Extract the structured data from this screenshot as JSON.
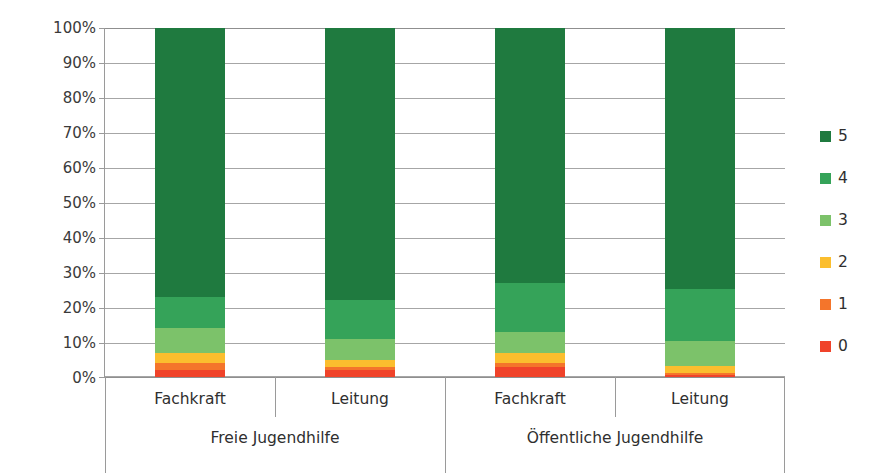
{
  "chart_data": {
    "type": "bar",
    "subtype": "stacked-percent",
    "title": "",
    "xlabel": "",
    "ylabel": "",
    "ylim": [
      0,
      100
    ],
    "y_tick_labels": [
      "0%",
      "10%",
      "20%",
      "30%",
      "40%",
      "50%",
      "60%",
      "70%",
      "80%",
      "90%",
      "100%"
    ],
    "y_tick_values": [
      0,
      10,
      20,
      30,
      40,
      50,
      60,
      70,
      80,
      90,
      100
    ],
    "grid": true,
    "legend_position": "right",
    "categories": [
      "Fachkraft",
      "Leitung",
      "Fachkraft",
      "Leitung"
    ],
    "groups": [
      {
        "label": "Freie Jugendhilfe",
        "categories": [
          "Fachkraft",
          "Leitung"
        ]
      },
      {
        "label": "Öffentliche Jugendhilfe",
        "categories": [
          "Fachkraft",
          "Leitung"
        ]
      }
    ],
    "series": [
      {
        "name": "0",
        "color": "#F0432A",
        "values": [
          2.0,
          2.0,
          3.0,
          0.6
        ]
      },
      {
        "name": "1",
        "color": "#F4752B",
        "values": [
          2.0,
          1.0,
          1.0,
          0.6
        ]
      },
      {
        "name": "2",
        "color": "#FBBE2E",
        "values": [
          3.0,
          2.0,
          3.0,
          2.0
        ]
      },
      {
        "name": "3",
        "color": "#7CC26A",
        "values": [
          7.0,
          6.0,
          6.0,
          7.0
        ]
      },
      {
        "name": "4",
        "color": "#35A359",
        "values": [
          9.0,
          11.0,
          14.0,
          15.0
        ]
      },
      {
        "name": "5",
        "color": "#1F7A3F",
        "values": [
          77.0,
          78.0,
          73.0,
          74.8
        ]
      }
    ]
  },
  "legend": {
    "items": [
      {
        "label": "5",
        "color": "#1F7A3F"
      },
      {
        "label": "4",
        "color": "#35A359"
      },
      {
        "label": "3",
        "color": "#7CC26A"
      },
      {
        "label": "2",
        "color": "#FBBE2E"
      },
      {
        "label": "1",
        "color": "#F4752B"
      },
      {
        "label": "0",
        "color": "#F0432A"
      }
    ]
  },
  "axis": {
    "y_labels": [
      "100%",
      "90%",
      "80%",
      "70%",
      "60%",
      "50%",
      "40%",
      "30%",
      "20%",
      "10%",
      "0%"
    ],
    "category_labels": [
      "Fachkraft",
      "Leitung",
      "Fachkraft",
      "Leitung"
    ],
    "group_labels": [
      "Freie Jugendhilfe",
      "Öffentliche Jugendhilfe"
    ]
  },
  "colors": {
    "grid": "#a6a6a6",
    "axis": "#9a9a9a",
    "text": "#2f2f2f",
    "background": "#ffffff"
  }
}
